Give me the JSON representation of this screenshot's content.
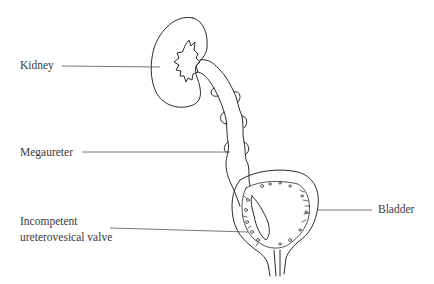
{
  "diagram": {
    "type": "anatomical-illustration",
    "labels": {
      "kidney": "Kidney",
      "megaureter": "Megaureter",
      "valve_line1": "Incompetent",
      "valve_line2": "ureterovesical valve",
      "bladder": "Bladder"
    },
    "colors": {
      "background": "#ffffff",
      "ink": "#2a2a2a",
      "leader_line": "#555555",
      "text": "#3a3a3a"
    }
  }
}
